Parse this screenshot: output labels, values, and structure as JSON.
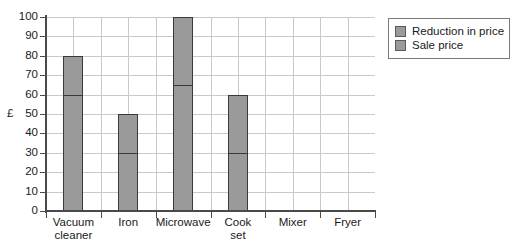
{
  "chart_data": {
    "type": "bar",
    "title": "",
    "subtitle": "",
    "xlabel": "",
    "ylabel": "£",
    "ylim": [
      0,
      100
    ],
    "ytick_step": 10,
    "yticks": [
      0,
      10,
      20,
      30,
      40,
      50,
      60,
      70,
      80,
      90,
      100
    ],
    "ytick_labels": [
      "0",
      "10",
      "20",
      "30",
      "40",
      "50",
      "60",
      "70",
      "80",
      "90",
      "100"
    ],
    "grid": true,
    "grid_axis": "both",
    "stacked": true,
    "legend_position": "right-top",
    "categories": [
      "Vacuum cleaner",
      "Iron",
      "Microwave",
      "Cook set",
      "Mixer",
      "Fryer"
    ],
    "category_lines": [
      [
        "Vacuum",
        "cleaner"
      ],
      [
        "Iron"
      ],
      [
        "Microwave"
      ],
      [
        "Cook",
        "set"
      ],
      [
        "Mixer"
      ],
      [
        "Fryer"
      ]
    ],
    "series": [
      {
        "name": "Sale price",
        "color": "#9a9a9a",
        "values": [
          60,
          30,
          65,
          30,
          0,
          0
        ]
      },
      {
        "name": "Reduction in price",
        "color": "#9a9a9a",
        "values": [
          20,
          20,
          35,
          30,
          0,
          0
        ]
      }
    ],
    "bar_totals": [
      80,
      50,
      100,
      60,
      0,
      0
    ],
    "colors": {
      "bar_fill": "#9a9a9a",
      "bar_edge": "#3a3a3a",
      "grid": "#c9c9c9",
      "axis": "#4a4a4a",
      "text": "#1a1a1a",
      "background": "#ffffff"
    }
  },
  "legend": {
    "items": [
      {
        "label": "Reduction in price",
        "color": "#9a9a9a"
      },
      {
        "label": "Sale price",
        "color": "#9a9a9a"
      }
    ]
  }
}
